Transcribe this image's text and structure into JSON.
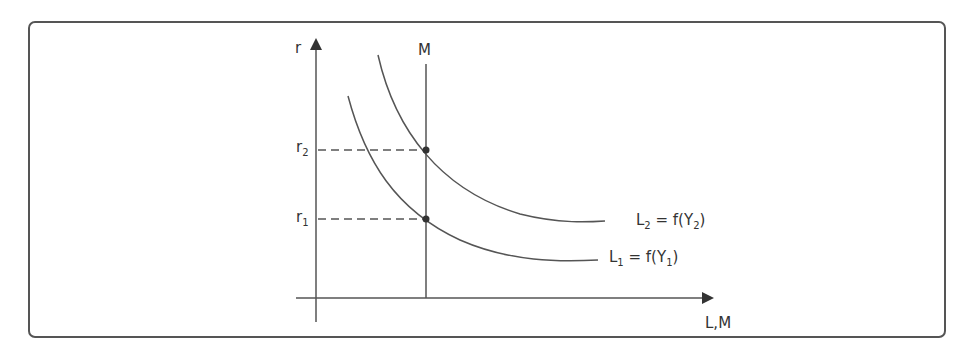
{
  "diagram": {
    "y_axis_label": "r",
    "x_axis_label": "L,M",
    "money_supply_label": "M",
    "r_levels": [
      {
        "base": "r",
        "sub": "2"
      },
      {
        "base": "r",
        "sub": "1"
      }
    ],
    "curves": [
      {
        "base": "L",
        "sub": "2",
        "eq": " = f(Y",
        "sub2": "2",
        "close": ")"
      },
      {
        "base": "L",
        "sub": "1",
        "eq": " = f(Y",
        "sub2": "1",
        "close": ")"
      }
    ],
    "colors": {
      "line": "#555555",
      "border": "#555555",
      "text": "#333333"
    }
  }
}
